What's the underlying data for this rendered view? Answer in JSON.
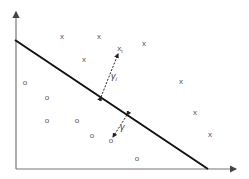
{
  "diagram": {
    "title": "",
    "type": "linear separator with margin",
    "colors": {
      "axis": "#777777",
      "separator": "#111111",
      "markers": "#555555",
      "labels": "#333333"
    },
    "axes": {
      "origin": [
        16,
        169
      ],
      "y_axis_top": [
        16,
        12
      ],
      "x_axis_right": [
        236,
        169
      ]
    },
    "separator_line": {
      "from": [
        15,
        40
      ],
      "to": [
        208,
        169
      ]
    },
    "class_x": {
      "symbol": "x",
      "points": [
        [
          62,
          37
        ],
        [
          99,
          37
        ],
        [
          144,
          44
        ],
        [
          84,
          60
        ],
        [
          181,
          82
        ],
        [
          195,
          113
        ],
        [
          210,
          135
        ]
      ]
    },
    "class_o": {
      "symbol": "o",
      "points": [
        [
          25,
          83
        ],
        [
          47,
          98
        ],
        [
          47,
          121
        ],
        [
          77,
          121
        ],
        [
          92,
          136
        ],
        [
          111,
          141
        ],
        [
          137,
          159
        ]
      ]
    },
    "highlighted_point_x": {
      "symbol": "x",
      "subscript": "i",
      "pos": [
        120,
        49
      ]
    },
    "margin_arrows": [
      {
        "name": "gamma-i",
        "from": [
          101,
          97
        ],
        "to": [
          118,
          54
        ],
        "label": "γ",
        "subscript": "i",
        "label_pos": [
          111,
          79
        ]
      },
      {
        "name": "gamma",
        "from": [
          127,
          115
        ],
        "to": [
          113,
          137
        ],
        "label": "γ",
        "subscript": "",
        "label_pos": [
          120,
          130
        ]
      }
    ]
  }
}
